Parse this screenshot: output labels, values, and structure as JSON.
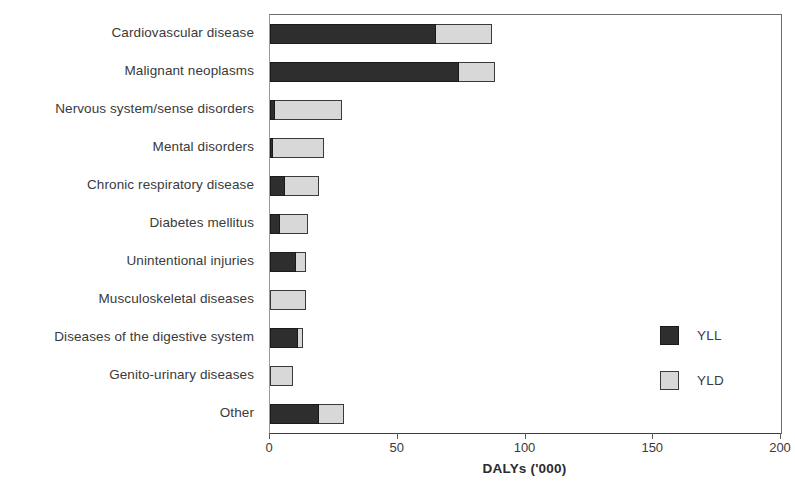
{
  "chart_data": {
    "type": "bar",
    "orientation": "horizontal",
    "stacked": true,
    "title": "",
    "xlabel": "DALYs ('000)",
    "ylabel": "",
    "xlim": [
      0,
      200
    ],
    "xticks": [
      0,
      50,
      100,
      150,
      200
    ],
    "xticklabels": [
      "0",
      "50",
      "100",
      "150",
      "200"
    ],
    "grid": false,
    "legend_position": "right-inside",
    "categories": [
      "Cardiovascular disease",
      "Malignant neoplasms",
      "Nervous system/sense disorders",
      "Mental disorders",
      "Chronic respiratory disease",
      "Diabetes mellitus",
      "Unintentional injuries",
      "Musculoskeletal diseases",
      "Diseases of the digestive system",
      "Genito-urinary diseases",
      "Other"
    ],
    "series": [
      {
        "name": "YLL",
        "color": "#2e2e2e",
        "values": [
          65,
          74,
          2,
          1,
          6,
          4,
          10,
          0,
          11,
          0,
          19
        ]
      },
      {
        "name": "YLD",
        "color": "#d8d8d8",
        "values": [
          22,
          14,
          26,
          20,
          13,
          11,
          4,
          14,
          2,
          9,
          10
        ]
      }
    ],
    "totals": [
      87,
      88,
      28,
      21,
      19,
      15,
      14,
      14,
      13,
      9,
      29
    ]
  },
  "legend": {
    "items": [
      {
        "label": "YLL",
        "swatch": "dark-square-icon"
      },
      {
        "label": "YLD",
        "swatch": "light-square-icon"
      }
    ]
  }
}
